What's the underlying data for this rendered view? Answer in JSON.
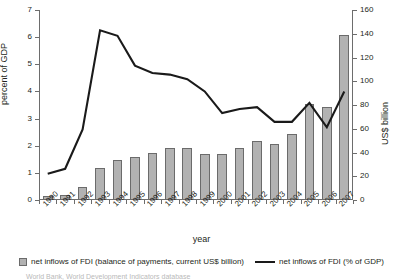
{
  "axis_titles": {
    "left": "percent of GDP",
    "right": "US$ billion",
    "bottom": "year"
  },
  "legend": {
    "bar_label": "net inflows of FDI (balance of payments, current US$ billion)",
    "line_label": "net inflows of FDI (% of GDP)",
    "bar_swatch": "bar-swatch-icon",
    "line_swatch": "line-swatch-icon"
  },
  "source_note": "World Bank, World Development Indicators database",
  "colors": {
    "bar_fill": "#b2b2b2",
    "bar_stroke": "#6b6b6b",
    "line": "#1a1a1a",
    "axis": "#6d6d6d",
    "text": "#231f20"
  },
  "chart_data": {
    "type": "bar",
    "title": "",
    "subtitle": "",
    "xlabel": "year",
    "ylabel": "percent of GDP",
    "y2label": "US$ billion",
    "grid": false,
    "legend_position": "bottom",
    "categories": [
      "1990",
      "1991",
      "1992",
      "1993",
      "1994",
      "1995",
      "1996",
      "1997",
      "1998",
      "1999",
      "2000",
      "2001",
      "2002",
      "2003",
      "2004",
      "2005",
      "2006",
      "2007"
    ],
    "ylim": [
      0,
      7
    ],
    "y2lim": [
      0,
      160
    ],
    "yticks": [
      0,
      1,
      2,
      3,
      4,
      5,
      6,
      7
    ],
    "y2ticks": [
      0,
      20,
      40,
      60,
      80,
      100,
      120,
      140,
      160
    ],
    "series": [
      {
        "name": "net inflows of FDI (balance of payments, current US$ billion)",
        "type": "bar",
        "axis": "y2",
        "unit": "US$ billion",
        "values": [
          3.5,
          4.0,
          11.0,
          27.0,
          33.5,
          36.0,
          40.0,
          44.0,
          44.0,
          38.5,
          38.5,
          44.0,
          49.5,
          47.0,
          55.5,
          80.5,
          78.5,
          139.0
        ]
      },
      {
        "name": "net inflows of FDI (% of GDP)",
        "type": "line",
        "axis": "y",
        "unit": "percent of GDP",
        "values": [
          0.97,
          1.15,
          2.6,
          6.25,
          6.05,
          4.95,
          4.68,
          4.62,
          4.45,
          4.0,
          3.2,
          3.35,
          3.42,
          2.88,
          2.88,
          3.58,
          2.68,
          4.0
        ]
      }
    ]
  }
}
